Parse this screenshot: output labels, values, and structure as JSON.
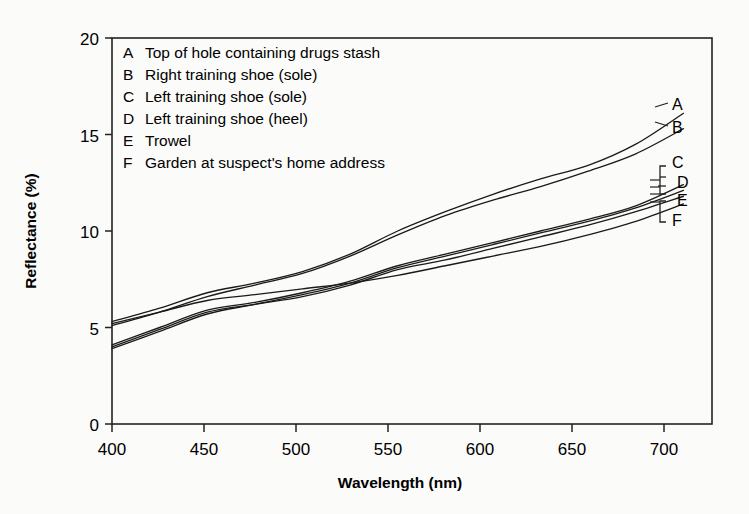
{
  "chart_data": {
    "type": "line",
    "title": "",
    "xlabel": "Wavelength (nm)",
    "ylabel": "Reflectance (%)",
    "xlim": [
      400,
      715
    ],
    "ylim": [
      0,
      20
    ],
    "xticks": [
      400,
      450,
      500,
      550,
      600,
      650,
      700
    ],
    "xtick_labels": [
      "400",
      "450",
      "500",
      "550",
      "600",
      "650",
      "700"
    ],
    "yticks": [
      0,
      5,
      10,
      15,
      20
    ],
    "ytick_labels": [
      "0",
      "5",
      "10",
      "15",
      "20"
    ],
    "grid": false,
    "legend_position": "inside-top-left",
    "x": [
      400,
      425,
      450,
      475,
      500,
      525,
      550,
      575,
      600,
      625,
      650,
      675,
      700
    ],
    "series": [
      {
        "name": "A",
        "label": "Top of hole containing drugs stash",
        "values": [
          5.3,
          6.0,
          6.8,
          7.3,
          7.9,
          8.8,
          10.0,
          11.0,
          11.9,
          12.7,
          13.4,
          14.5,
          16.1
        ]
      },
      {
        "name": "B",
        "label": "Right training shoe (sole)",
        "values": [
          5.1,
          5.8,
          6.6,
          7.2,
          7.8,
          8.7,
          9.8,
          10.8,
          11.6,
          12.3,
          13.1,
          14.0,
          15.3
        ]
      },
      {
        "name": "C",
        "label": "Left training shoe (sole)",
        "values": [
          4.1,
          5.0,
          5.9,
          6.3,
          6.8,
          7.4,
          8.2,
          8.8,
          9.4,
          10.0,
          10.6,
          11.3,
          12.4
        ]
      },
      {
        "name": "D",
        "label": "Left training shoe (heel)",
        "values": [
          3.9,
          4.8,
          5.7,
          6.2,
          6.7,
          7.3,
          8.1,
          8.7,
          9.3,
          9.9,
          10.5,
          11.2,
          12.1
        ]
      },
      {
        "name": "E",
        "label": "Trowel",
        "values": [
          4.0,
          4.9,
          5.8,
          6.2,
          6.6,
          7.2,
          8.0,
          8.5,
          9.1,
          9.7,
          10.3,
          11.0,
          11.8
        ]
      },
      {
        "name": "F",
        "label": "Garden at suspect's home address",
        "values": [
          5.2,
          5.8,
          6.4,
          6.7,
          7.0,
          7.3,
          7.7,
          8.2,
          8.7,
          9.2,
          9.8,
          10.5,
          11.4
        ]
      }
    ],
    "legend_entries": [
      {
        "key": "A",
        "text": "Top of hole containing drugs stash"
      },
      {
        "key": "B",
        "text": "Right training shoe (sole)"
      },
      {
        "key": "C",
        "text": "Left training shoe (sole)"
      },
      {
        "key": "D",
        "text": "Left training shoe (heel)"
      },
      {
        "key": "E",
        "text": "Trowel"
      },
      {
        "key": "F",
        "text": "Garden at suspect's home address"
      }
    ],
    "end_labels": [
      "A",
      "B",
      "C",
      "D",
      "E",
      "F"
    ],
    "colors": {
      "curve": "#1b1b1b",
      "axis": "#222222",
      "background": "#fbfbfa"
    }
  }
}
